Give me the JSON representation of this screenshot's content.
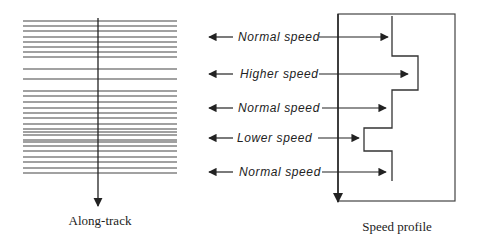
{
  "colors": {
    "ink": "#222222",
    "line": "#444444",
    "background": "#ffffff"
  },
  "left_panel": {
    "caption": "Along-track",
    "line_x1": 23,
    "line_x2": 177,
    "line_ys": [
      21,
      26,
      31,
      37,
      42,
      47,
      52,
      57,
      69,
      79,
      91,
      96,
      102,
      108,
      113,
      118,
      124,
      129,
      132,
      135,
      140,
      142,
      146,
      151,
      157,
      162,
      168,
      173
    ],
    "arrow": {
      "x": 98,
      "y1": 18,
      "y2": 206
    }
  },
  "right_panel": {
    "caption": "Speed profile",
    "box": {
      "x": 338,
      "y": 14,
      "w": 117,
      "h": 187
    },
    "down_arrow": {
      "x": 338,
      "y1": 14,
      "y2": 202
    },
    "profile_points": [
      [
        392,
        16
      ],
      [
        392,
        56
      ],
      [
        418,
        56
      ],
      [
        418,
        90
      ],
      [
        392,
        90
      ],
      [
        392,
        128
      ],
      [
        364,
        128
      ],
      [
        364,
        151
      ],
      [
        392,
        151
      ],
      [
        392,
        181
      ]
    ],
    "labels": [
      {
        "text": "Normal speed",
        "y": 37,
        "text_x": 238,
        "right_arrow_start": 319,
        "right_arrow_end": 388
      },
      {
        "text": "Higher speed",
        "y": 74,
        "text_x": 240,
        "right_arrow_start": 319,
        "right_arrow_end": 408
      },
      {
        "text": "Normal speed",
        "y": 108,
        "text_x": 238,
        "right_arrow_start": 322,
        "right_arrow_end": 386
      },
      {
        "text": "Lower speed",
        "y": 138,
        "text_x": 237,
        "right_arrow_start": 318,
        "right_arrow_end": 359
      },
      {
        "text": "Normal speed",
        "y": 172,
        "text_x": 239,
        "right_arrow_start": 322,
        "right_arrow_end": 386
      }
    ],
    "left_arrow_tip_x": 209,
    "left_arrow_tail_x": 233
  }
}
